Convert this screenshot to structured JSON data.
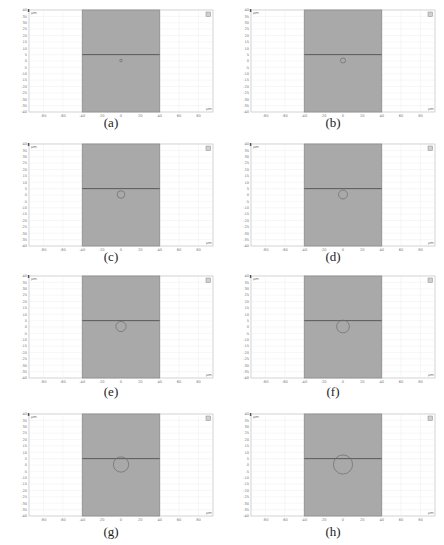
{
  "figure": {
    "colors": {
      "background": "#ffffff",
      "axes_frame": "#b4b4b4",
      "grid": "#ececec",
      "domain_fill": "#a9a9a9",
      "domain_edge": "#8c8c8c",
      "interface_line": "#5a5a5a",
      "circle": "#6b6b6b",
      "tick_text": "#777777"
    },
    "axes": {
      "unit_label": "μm",
      "x_ticks": [
        "-80",
        "-60",
        "-40",
        "-20",
        "0",
        "20",
        "40",
        "60",
        "80"
      ],
      "y_ticks": [
        "40",
        "35",
        "30",
        "25",
        "20",
        "15",
        "10",
        "5",
        "0",
        "-5",
        "-10",
        "-15",
        "-20",
        "-25",
        "-30",
        "-35",
        "-40"
      ],
      "x_range": [
        -95,
        95
      ],
      "y_range": [
        -40,
        40
      ]
    },
    "geometry": {
      "domain_x": [
        -40,
        40
      ],
      "domain_y": [
        -40,
        40
      ],
      "interface_y": 5,
      "circle_center": [
        0,
        0
      ]
    },
    "panels": [
      {
        "caption": "(a)",
        "circle_radius": 1
      },
      {
        "caption": "(b)",
        "circle_radius": 2
      },
      {
        "caption": "(c)",
        "circle_radius": 3
      },
      {
        "caption": "(d)",
        "circle_radius": 3.5
      },
      {
        "caption": "(e)",
        "circle_radius": 4
      },
      {
        "caption": "(f)",
        "circle_radius": 5
      },
      {
        "caption": "(g)",
        "circle_radius": 6
      },
      {
        "caption": "(h)",
        "circle_radius": 7.5
      }
    ]
  }
}
